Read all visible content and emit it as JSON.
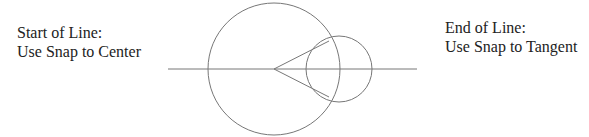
{
  "labels": {
    "start": {
      "line1": "Start of Line:",
      "line2": "Use Snap to Center"
    },
    "end": {
      "line1": "End of Line:",
      "line2": "Use Snap to Tangent"
    }
  },
  "geometry": {
    "large_circle": {
      "cx": 274,
      "cy": 69,
      "r": 66
    },
    "small_circle": {
      "cx": 339,
      "cy": 69,
      "r": 33
    },
    "axis_line": {
      "x1": 168,
      "x2": 417,
      "y": 69
    },
    "tangent_points": [
      [
        329,
        41
      ],
      [
        329,
        97
      ]
    ],
    "stroke_color": "#777777"
  }
}
